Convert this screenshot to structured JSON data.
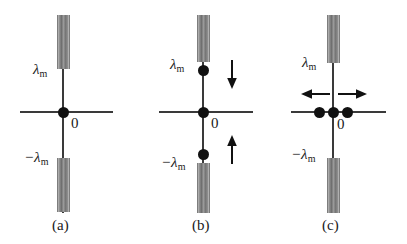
{
  "figure": {
    "background_color": "#ffffff",
    "bar_color": "#8a8a8a",
    "axis_color": "#3a3a3a",
    "dot_color": "#111111",
    "zero_label": "0",
    "lambda_symbol": "λ",
    "lambda_subscript": "m",
    "minus_sign": "−"
  },
  "panels": [
    {
      "id": "a",
      "caption": "(a)",
      "top_label": "λ",
      "top_label_sub": "m",
      "bottom_label": "−λ",
      "bottom_label_sub": "m",
      "origin_label": "0",
      "dots": [
        {
          "name": "origin-charge",
          "position": "origin"
        }
      ],
      "arrows": []
    },
    {
      "id": "b",
      "caption": "(b)",
      "top_label": "λ",
      "top_label_sub": "m",
      "bottom_label": "−λ",
      "bottom_label_sub": "m",
      "origin_label": "0",
      "dots": [
        {
          "name": "upper-charge",
          "position": "lambda-m"
        },
        {
          "name": "origin-charge",
          "position": "origin"
        },
        {
          "name": "lower-charge",
          "position": "minus-lambda-m"
        }
      ],
      "arrows": [
        {
          "name": "down-arrow",
          "direction": "down"
        },
        {
          "name": "up-arrow",
          "direction": "up"
        }
      ]
    },
    {
      "id": "c",
      "caption": "(c)",
      "top_label": "λ",
      "top_label_sub": "m",
      "bottom_label": "−λ",
      "bottom_label_sub": "m",
      "origin_label": "0",
      "dots": [
        {
          "name": "left-charge",
          "position": "left-of-origin"
        },
        {
          "name": "origin-charge",
          "position": "origin"
        },
        {
          "name": "right-charge",
          "position": "right-of-origin"
        }
      ],
      "arrows": [
        {
          "name": "left-arrow",
          "direction": "left"
        },
        {
          "name": "right-arrow",
          "direction": "right"
        }
      ]
    }
  ]
}
